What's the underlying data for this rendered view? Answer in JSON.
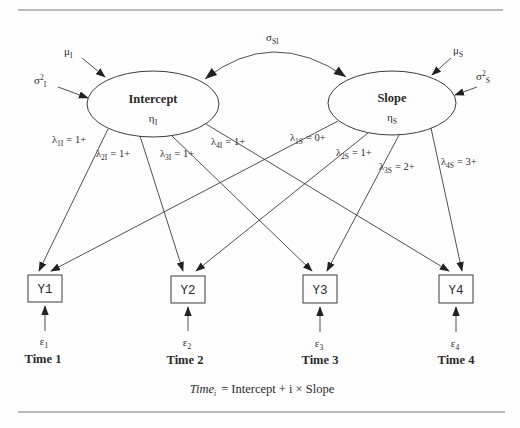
{
  "sym": {
    "lambda": "λ",
    "epsilon": "ε",
    "eta": "η",
    "mu": "μ",
    "sigma": "σ",
    "sq": "2"
  },
  "covariance": {
    "sub": "SI"
  },
  "intercept": {
    "title": "Intercept",
    "eta_sub": "I",
    "mu_sub": "I",
    "var_sub": "I"
  },
  "slope": {
    "title": "Slope",
    "eta_sub": "S",
    "mu_sub": "S",
    "var_sub": "S"
  },
  "loadings_intercept": [
    {
      "sub": "1I",
      "val": "= 1+"
    },
    {
      "sub": "2I",
      "val": "= 1+"
    },
    {
      "sub": "3I",
      "val": "= 1+"
    },
    {
      "sub": "4I",
      "val": "= 1+"
    }
  ],
  "loadings_slope": [
    {
      "sub": "1S",
      "val": "= 0+"
    },
    {
      "sub": "2S",
      "val": "= 1+"
    },
    {
      "sub": "3S",
      "val": "= 2+"
    },
    {
      "sub": "4S",
      "val": "= 3+"
    }
  ],
  "indicators": [
    {
      "label": "Y1",
      "err_sub": "1",
      "time": "Time 1"
    },
    {
      "label": "Y2",
      "err_sub": "2",
      "time": "Time 2"
    },
    {
      "label": "Y3",
      "err_sub": "3",
      "time": "Time 3"
    },
    {
      "label": "Y4",
      "err_sub": "4",
      "time": "Time 4"
    }
  ],
  "equation": {
    "var": "Time",
    "var_sub": "i",
    "rest": "= Intercept + i × Slope"
  },
  "colors": {
    "line": "#3d3d3d",
    "text": "#2b2b2b",
    "rule": "#a3a3a3",
    "bg": "#fdfdfd"
  }
}
